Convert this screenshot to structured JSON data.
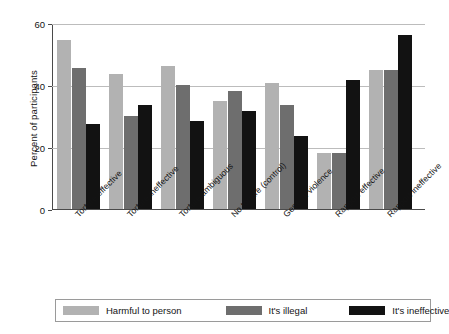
{
  "chart_data": {
    "type": "bar",
    "title": "",
    "xlabel": "",
    "ylabel": "Percent of participants",
    "ylim": [
      0,
      60
    ],
    "yticks": [
      0,
      20,
      40,
      60
    ],
    "grid": true,
    "legend_position": "bottom",
    "categories": [
      "Torture effective",
      "Torture ineffective",
      "Torture ambiguous",
      "No torture (control)",
      "General violence",
      "Rapport effective",
      "Rapport ineffective"
    ],
    "series": [
      {
        "name": "Harmful to person",
        "color": "#b2b2b2",
        "values": [
          54.5,
          43.5,
          46,
          35,
          40.5,
          18,
          45
        ]
      },
      {
        "name": "It's illegal",
        "color": "#6e6e6e",
        "values": [
          45.5,
          30,
          40,
          38,
          33.5,
          18,
          45
        ]
      },
      {
        "name": "It's ineffective",
        "color": "#121212",
        "values": [
          27.5,
          33.5,
          28.5,
          31.5,
          23.5,
          41.5,
          56
        ]
      }
    ]
  },
  "axis": {
    "tick_labels": [
      "0",
      "20",
      "40",
      "60"
    ]
  },
  "legend": {
    "items": [
      {
        "label": "Harmful to person",
        "swatch": "#b2b2b2"
      },
      {
        "label": "It's illegal",
        "swatch": "#6e6e6e"
      },
      {
        "label": "It's ineffective",
        "swatch": "#121212"
      }
    ]
  }
}
